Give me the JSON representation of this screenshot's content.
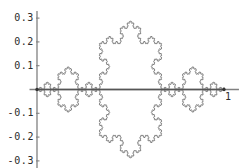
{
  "figure": {
    "width": 241,
    "height": 168,
    "background": "#ffffff"
  },
  "chart_data": {
    "type": "line",
    "title": "",
    "xlabel": "",
    "ylabel": "",
    "subtitle": "",
    "grid": false,
    "legend": null,
    "legend_position": "none",
    "xlim": [
      -0.04,
      1.08
    ],
    "ylim": [
      -0.33,
      0.33
    ],
    "xticks": [
      1
    ],
    "xtick_labels": [
      "1"
    ],
    "yticks": [
      0.3,
      0.2,
      0.1,
      -0.1,
      -0.2,
      -0.3
    ],
    "ytick_labels": [
      "0.3",
      "0.2",
      "0.1",
      "-0.1",
      "-0.2",
      "-0.3"
    ],
    "axis_color": "#808080",
    "curve_color": "#3a3a3a",
    "curve_width": 0.55,
    "series": [
      {
        "name": "koch-curve-upper",
        "generator": "koch",
        "iterations": 5,
        "orientation": "up",
        "x_start": 0,
        "x_end": 1,
        "y_base": 0,
        "peak_y": 0.2887,
        "point_count": 1025
      },
      {
        "name": "koch-curve-lower",
        "generator": "koch",
        "iterations": 5,
        "orientation": "down",
        "x_start": 0,
        "x_end": 1,
        "y_base": 0,
        "peak_y": -0.2887,
        "point_count": 1025
      },
      {
        "name": "baseline-axis",
        "generator": "line",
        "x_start": 0,
        "x_end": 1,
        "y_base": 0
      }
    ],
    "endpoint_markers": [
      {
        "x": 0,
        "y": 0
      },
      {
        "x": 1,
        "y": 0
      }
    ]
  },
  "axes": {
    "y_axis_label_texts": [
      "0.3",
      "0.2",
      "0.1",
      "-0.1",
      "-0.2",
      "-0.3"
    ],
    "x_axis_label_texts": [
      "1"
    ]
  }
}
